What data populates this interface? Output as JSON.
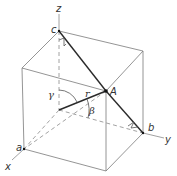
{
  "diagram": {
    "type": "3d-cube-vector-direction-cosines",
    "labels": {
      "z_axis": "z",
      "y_axis": "y",
      "x_axis": "x",
      "point_a": "a",
      "point_b": "b",
      "point_c": "c",
      "point_A": "A",
      "vector_r": "r",
      "angle_gamma": "γ",
      "angle_beta": "β"
    },
    "colors": {
      "edges": "#7a7a7a",
      "vector": "#2a2a2a",
      "labels": "#333333"
    }
  }
}
